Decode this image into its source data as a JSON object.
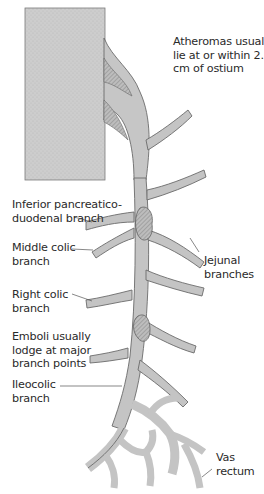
{
  "diagram": {
    "colors": {
      "aorta_fill": "#c9c9c9",
      "vessel_fill": "#c4c4c4",
      "vessel_outline": "#6b6b6b",
      "plaque_fill": "#b0b0b0",
      "text": "#2a2a2a"
    },
    "labels": {
      "atheromas": "Atheromas usually\nlie at or within 2.5\ncm of ostium",
      "inferior_pancreaticoduodenal": "Inferior pancreatico-\nduodenal branch",
      "middle_colic": "Middle colic\nbranch",
      "right_colic": "Right colic\nbranch",
      "emboli": "Emboli usually\nlodge at major\nbranch points",
      "ileocolic": "Ileocolic\nbranch",
      "jejunal": "Jejunal\nbranches",
      "vas_rectum": "Vas\nrectum"
    }
  }
}
